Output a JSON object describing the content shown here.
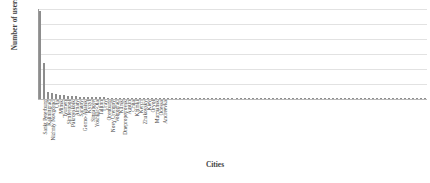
{
  "chart_data": {
    "type": "bar",
    "title": "",
    "xlabel": "Cities",
    "ylabel": "Number of users",
    "ylim": [
      0,
      300
    ],
    "yticks": [
      300,
      250,
      200,
      150,
      100,
      50,
      0
    ],
    "grid": true,
    "legend": "none",
    "bar_color": "#8d8d8d",
    "categories": [
      "Sankt Peterburg",
      "Kaliningrad",
      "Nizhniy Novgorod",
      "Ufa",
      "Minsk",
      "Tyumen",
      "Simferopol",
      "Pakrovskoik",
      "Almaty",
      "Saratov",
      "Gorno-Altaisk",
      "Kyzyl",
      "Singapore",
      "Yoshkar-Ola",
      "Tallinn",
      "Uray",
      "Orenburg",
      "Novy Urengoy",
      "Volgograd",
      "Kursk",
      "Dnepropetrovsk",
      "Austin",
      "Chita",
      "Khimki",
      "Kerch",
      "Zhukovsky",
      "Kiev",
      "Oryol",
      "Murmansk",
      "Odessa",
      "Andreevka"
    ],
    "values": [
      295,
      120,
      22,
      19,
      16,
      14,
      12,
      11,
      10,
      9,
      8,
      8,
      7,
      7,
      6,
      6,
      6,
      5,
      5,
      5,
      4,
      4,
      4,
      4,
      4,
      3,
      3,
      3,
      3,
      3,
      3
    ],
    "tail_values": [
      3,
      3,
      3,
      2,
      2,
      2,
      2,
      2,
      2,
      2,
      2,
      2,
      2,
      2,
      2,
      2,
      2,
      2,
      2,
      2,
      2,
      2,
      2,
      2,
      1,
      1,
      1,
      1,
      1,
      1,
      1,
      1,
      1,
      1,
      1,
      1,
      1,
      1,
      1,
      1,
      1,
      1,
      1,
      1,
      1,
      1,
      1,
      1,
      1,
      1,
      1,
      1,
      1,
      1,
      1,
      1,
      1,
      1,
      1,
      1,
      1,
      1,
      1,
      1,
      1,
      1
    ]
  },
  "axes": {
    "y_title": "Number of users",
    "x_title": "Cities"
  }
}
